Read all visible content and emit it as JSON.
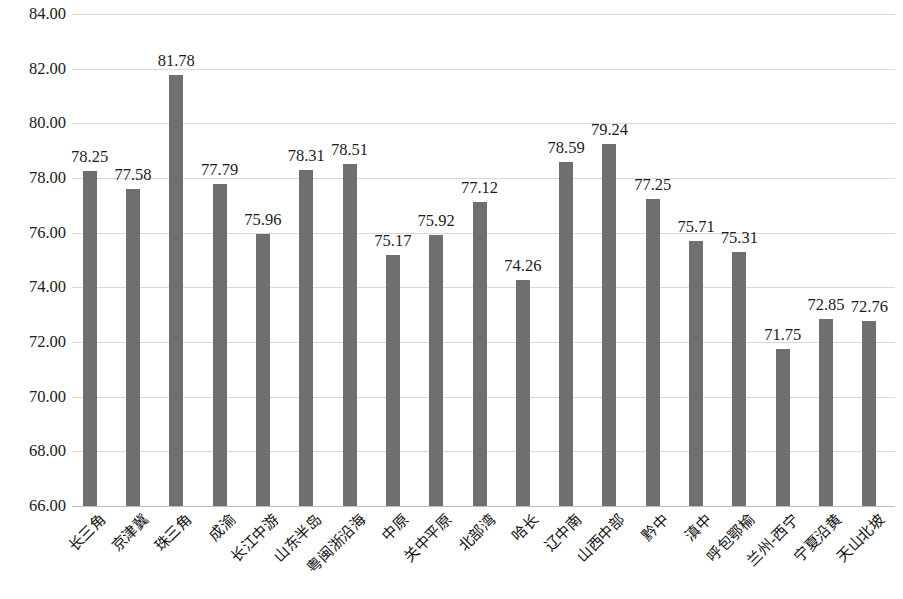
{
  "chart_data": {
    "type": "bar",
    "title": "",
    "subtitle": "",
    "xlabel": "",
    "ylabel": "",
    "ylim": [
      66.0,
      84.0
    ],
    "ytick_step": 2.0,
    "grid": true,
    "legend": false,
    "legend_position": "none",
    "bar_color": "#6f6f6f",
    "gridline_color": "#d9d9d9",
    "label_format": "0.00",
    "yticks": [
      "66.00",
      "68.00",
      "70.00",
      "72.00",
      "74.00",
      "76.00",
      "78.00",
      "80.00",
      "82.00",
      "84.00"
    ],
    "ytick_values": [
      66.0,
      68.0,
      70.0,
      72.0,
      74.0,
      76.0,
      78.0,
      80.0,
      82.0,
      84.0
    ],
    "categories": [
      "长三角",
      "京津冀",
      "珠三角",
      "成渝",
      "长江中游",
      "山东半岛",
      "粤闽浙沿海",
      "中原",
      "关中平原",
      "北部湾",
      "哈长",
      "辽中南",
      "山西中部",
      "黔中",
      "滇中",
      "呼包鄂榆",
      "兰州-西宁",
      "宁夏沿黄",
      "天山北坡"
    ],
    "values": [
      78.25,
      77.58,
      81.78,
      77.79,
      75.96,
      78.31,
      78.51,
      75.17,
      75.92,
      77.12,
      74.26,
      78.59,
      79.24,
      77.25,
      75.71,
      75.31,
      71.75,
      72.85,
      72.76
    ],
    "value_labels": [
      "78.25",
      "77.58",
      "81.78",
      "77.79",
      "75.96",
      "78.31",
      "78.51",
      "75.17",
      "75.92",
      "77.12",
      "74.26",
      "78.59",
      "79.24",
      "77.25",
      "75.71",
      "75.31",
      "71.75",
      "72.85",
      "72.76"
    ]
  }
}
